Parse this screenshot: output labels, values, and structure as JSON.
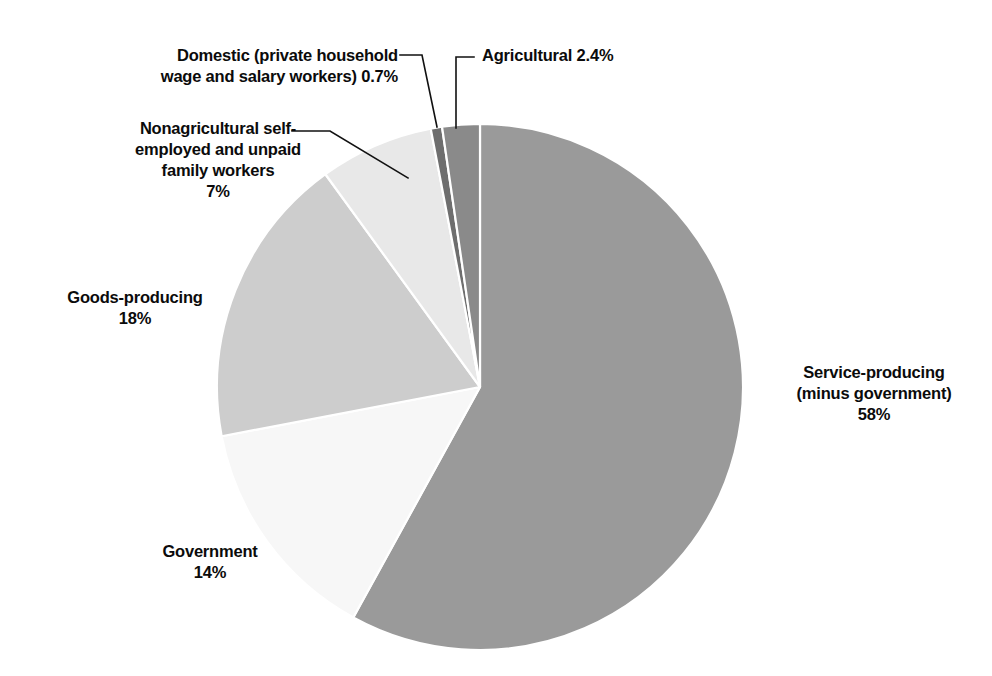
{
  "figure": {
    "title": "",
    "background_color": "#ffffff",
    "text_color": "#0b0b0b",
    "top_cut_fragment": ""
  },
  "chart_data": {
    "type": "pie",
    "title": "",
    "subtitle": "",
    "xlabel": "",
    "ylabel": "",
    "legend_position": "none",
    "grid": false,
    "total": 100.1,
    "units": "percent",
    "start_angle_deg": 0,
    "direction": "clockwise",
    "center": {
      "x": 480,
      "y": 387
    },
    "radius": 263,
    "categories": [
      "Service-producing (minus government)",
      "Government",
      "Goods-producing",
      "Nonagricultural self-employed and unpaid family workers",
      "Domestic (private household wage and salary workers)",
      "Agricultural"
    ],
    "values": [
      58,
      14,
      18,
      7,
      0.7,
      2.4
    ],
    "value_labels": [
      "58%",
      "14%",
      "18%",
      "7%",
      "0.7%",
      "2.4%"
    ],
    "colors": [
      "#9a9a9a",
      "#f7f7f7",
      "#cdcdcd",
      "#e8e8e8",
      "#6e6e6e",
      "#8a8a8a"
    ],
    "slice_border_color": "#ffffff",
    "slices": [
      {
        "name": "service-producing",
        "label": "Service-producing\n(minus government)\n58%",
        "label_lines": [
          "Service-producing",
          "(minus government)",
          "58%"
        ],
        "value": 58,
        "value_label": "58%",
        "color": "#9a9a9a",
        "start_deg": 0,
        "end_deg": 208.8,
        "leader": false
      },
      {
        "name": "government",
        "label": "Government\n14%",
        "label_lines": [
          "Government",
          "14%"
        ],
        "value": 14,
        "value_label": "14%",
        "color": "#f7f7f7",
        "start_deg": 208.8,
        "end_deg": 259.2,
        "leader": false
      },
      {
        "name": "goods-producing",
        "label": "Goods-producing\n18%",
        "label_lines": [
          "Goods-producing",
          "18%"
        ],
        "value": 18,
        "value_label": "18%",
        "color": "#cdcdcd",
        "start_deg": 259.2,
        "end_deg": 324.0,
        "leader": false
      },
      {
        "name": "nonagricultural-self-employed",
        "label": "Nonagricultural self-\nemployed and unpaid\nfamily workers\n7%",
        "label_lines": [
          "Nonagricultural self-",
          "employed and unpaid",
          "family workers",
          "7%"
        ],
        "value": 7,
        "value_label": "7%",
        "color": "#e8e8e8",
        "start_deg": 324.0,
        "end_deg": 349.2,
        "leader": true
      },
      {
        "name": "domestic",
        "label": "Domestic (private household\nwage and salary workers) 0.7%",
        "label_lines": [
          "Domestic (private household",
          "wage and salary workers) 0.7%"
        ],
        "value": 0.7,
        "value_label": "0.7%",
        "color": "#6e6e6e",
        "start_deg": 349.2,
        "end_deg": 351.7,
        "leader": true
      },
      {
        "name": "agricultural",
        "label": "Agricultural 2.4%",
        "label_lines": [
          "Agricultural 2.4%"
        ],
        "value": 2.4,
        "value_label": "2.4%",
        "color": "#8a8a8a",
        "start_deg": 351.7,
        "end_deg": 360.0,
        "leader": true
      }
    ]
  },
  "labels": {
    "domestic": "Domestic (private household\nwage and salary workers) 0.7%",
    "agricultural": "Agricultural 2.4%",
    "nonagricultural": "Nonagricultural self-\nemployed and unpaid\nfamily workers\n7%",
    "goods": "Goods-producing\n18%",
    "government": "Government\n14%",
    "service": "Service-producing\n(minus government)\n58%"
  }
}
